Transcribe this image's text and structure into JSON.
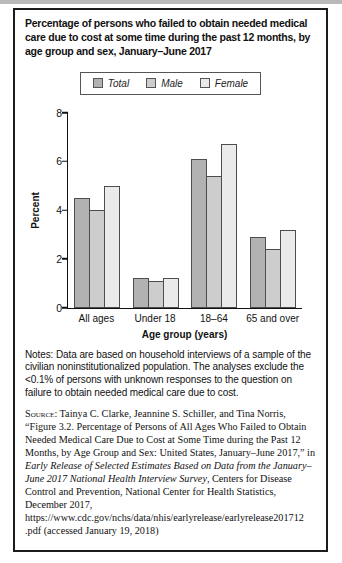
{
  "figure": {
    "notes": "Notes: Data are based on household interviews of a sample of the civilian noninstitutionalized population. The analyses exclude the <0.1% of persons with unknown responses to the question on failure to obtain needed medical care due to cost.",
    "source_label": "Source:",
    "source_segments": [
      {
        "text": " Tainya C. Clarke, Jeannine S. Schiller, and Tina Norris, “Figure 3.2. Percentage of Persons of All Ages Who Failed to Obtain Needed Medical Care Due to Cost at Some Time during the Past 12 Months, by Age Group and Sex: United States, January–June 2017,” in ",
        "italic": false
      },
      {
        "text": "Early Release of Selected Estimates Based on Data from the January–June 2017 National Health Interview Survey",
        "italic": true
      },
      {
        "text": ", Centers for Disease Control and Prevention, National Center for Health Statistics, December 2017, https://www.cdc.gov/nchs/data/nhis/earlyrelease/earlyrelease201712 .pdf (accessed January 19, 2018)",
        "italic": false
      }
    ]
  },
  "chart_data": {
    "type": "bar",
    "title": "Percentage of persons who failed to obtain needed medical care due to cost at some time during the past 12 months, by age group and sex, January–June 2017",
    "categories": [
      "All ages",
      "Under 18",
      "18–64",
      "65 and over"
    ],
    "series": [
      {
        "name": "Total",
        "color": "#b2b2b2",
        "values": [
          4.5,
          1.2,
          6.1,
          2.9
        ]
      },
      {
        "name": "Male",
        "color": "#cdcdcd",
        "values": [
          4.0,
          1.1,
          5.4,
          2.4
        ]
      },
      {
        "name": "Female",
        "color": "#eaeaea",
        "values": [
          5.0,
          1.2,
          6.7,
          3.2
        ]
      }
    ],
    "xlabel": "Age group (years)",
    "ylabel": "Percent",
    "ylim": [
      0,
      8
    ],
    "yticks": [
      0,
      2,
      4,
      6,
      8
    ],
    "legend_position": "top-center",
    "grid": false,
    "bar_border_color": "#4d4d4d",
    "axis_color": "#111111"
  }
}
